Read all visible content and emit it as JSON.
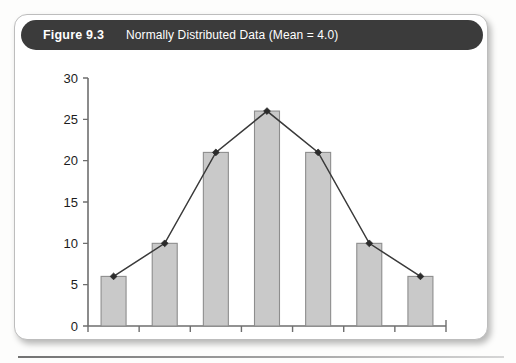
{
  "figure": {
    "label": "Figure 9.3",
    "caption": "Normally Distributed Data (Mean = 4.0)",
    "header_bg": "#3b3b3b",
    "card_bg": "#ffffff"
  },
  "chart_data": {
    "type": "bar",
    "title": "Normally Distributed Data (Mean = 4.0)",
    "categories": [
      "1",
      "2",
      "3",
      "4",
      "5",
      "6",
      "7"
    ],
    "values": [
      6,
      10,
      21,
      26,
      21,
      10,
      6
    ],
    "series": [
      {
        "name": "Frequency",
        "type": "bar",
        "values": [
          6,
          10,
          21,
          26,
          21,
          10,
          6
        ]
      },
      {
        "name": "Distribution curve",
        "type": "line",
        "values": [
          6,
          10,
          21,
          26,
          21,
          10,
          6
        ]
      }
    ],
    "xlabel": "",
    "ylabel": "",
    "ylim": [
      0,
      30
    ],
    "yticks": [
      0,
      5,
      10,
      15,
      20,
      25,
      30
    ],
    "xticks": [
      "1",
      "2",
      "3",
      "4",
      "5",
      "6",
      "7"
    ],
    "grid": false,
    "legend": null,
    "bar_color": "#c9c9c9",
    "bar_border_color": "#8d8d8d",
    "line_color": "#3a3a3a",
    "marker_color": "#2b2b2b",
    "mean": 4.0
  }
}
